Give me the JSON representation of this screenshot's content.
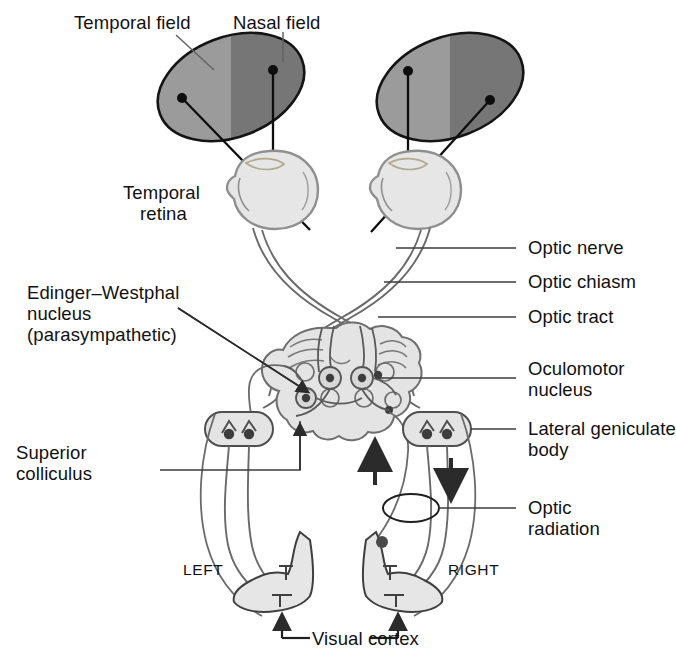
{
  "diagram": {
    "colors": {
      "field_light_gray": "#9b9b9b",
      "field_dark_gray": "#767676",
      "outline": "#1a1a1a",
      "tissue_fill": "#e2e2e2",
      "tissue_stroke": "#6d6d6d",
      "nucleus_dot": "#4a4a4a",
      "background": "#ffffff"
    },
    "labels": {
      "temporal_field": "Temporal field",
      "nasal_field": "Nasal field",
      "temporal_retina_line1": "Temporal",
      "temporal_retina_line2": "retina",
      "edinger_line1": "Edinger–Westphal",
      "edinger_line2": "nucleus",
      "edinger_line3": "(parasympathetic)",
      "superior_colliculus_line1": "Superior",
      "superior_colliculus_line2": "colliculus",
      "optic_nerve": "Optic nerve",
      "optic_chiasm": "Optic chiasm",
      "optic_tract": "Optic tract",
      "oculomotor_line1": "Oculomotor",
      "oculomotor_line2": "nucleus",
      "lateral_geniculate_line1": "Lateral geniculate",
      "lateral_geniculate_line2": "body",
      "optic_radiation_line1": "Optic",
      "optic_radiation_line2": "radiation",
      "side_left": "LEFT",
      "side_right": "RIGHT",
      "visual_cortex": "Visual cortex"
    }
  }
}
